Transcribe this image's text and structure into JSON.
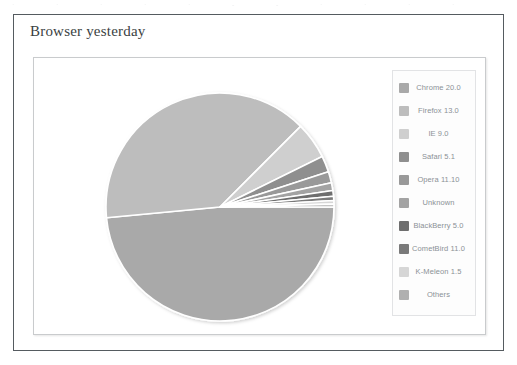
{
  "figure": {
    "title": "Browser yesterday"
  },
  "scan_artifacts": {
    "top_marks": [
      "·",
      "·",
      "·",
      "·",
      "·",
      "-",
      "-",
      "·",
      "·",
      "·",
      "·"
    ]
  },
  "legend": {
    "position": "right",
    "items": [
      {
        "label": "Chrome 20.0",
        "color": "#a9a9a9"
      },
      {
        "label": "Firefox 13.0",
        "color": "#bdbdbd"
      },
      {
        "label": "IE 9.0",
        "color": "#cfcfcf"
      },
      {
        "label": "Safari 5.1",
        "color": "#8f8f8f"
      },
      {
        "label": "Opera 11.10",
        "color": "#999999"
      },
      {
        "label": "Unknown",
        "color": "#a3a3a3"
      },
      {
        "label": "BlackBerry 5.0",
        "color": "#6e6e6e"
      },
      {
        "label": "CometBird 11.0",
        "color": "#7a7a7a"
      },
      {
        "label": "K-Meleon 1.5",
        "color": "#d6d6d6"
      },
      {
        "label": "Others",
        "color": "#b0b0b0"
      }
    ]
  },
  "chart_data": {
    "type": "pie",
    "title": "Browser yesterday",
    "xlabel": "",
    "ylabel": "",
    "grid": false,
    "legend_position": "right",
    "categories": [
      "Chrome 20.0",
      "Firefox 13.0",
      "IE 9.0",
      "Safari 5.1",
      "Opera 11.10",
      "Unknown",
      "BlackBerry 5.0",
      "CometBird 11.0",
      "K-Meleon 1.5",
      "Others"
    ],
    "values": [
      48.5,
      39.0,
      5.2,
      2.3,
      1.6,
      1.1,
      0.8,
      0.6,
      0.5,
      0.4
    ],
    "colors": [
      "#a9a9a9",
      "#bdbdbd",
      "#cfcfcf",
      "#8f8f8f",
      "#999999",
      "#a3a3a3",
      "#6e6e6e",
      "#7a7a7a",
      "#d6d6d6",
      "#b0b0b0"
    ],
    "units": "percent",
    "slice_separator_color": "#ffffff",
    "start_angle_deg": 0,
    "direction": "clockwise"
  }
}
